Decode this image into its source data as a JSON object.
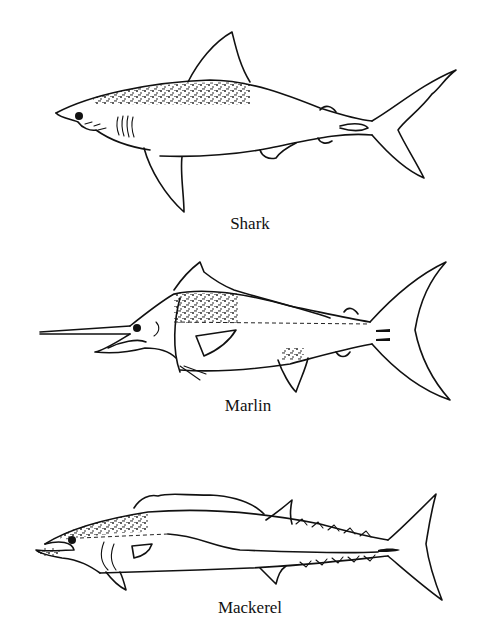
{
  "figure": {
    "background": "#ffffff",
    "ink_color": "#111111",
    "fish": [
      {
        "id": "shark",
        "label": "Shark"
      },
      {
        "id": "marlin",
        "label": "Marlin"
      },
      {
        "id": "mackerel",
        "label": "Mackerel"
      }
    ]
  }
}
